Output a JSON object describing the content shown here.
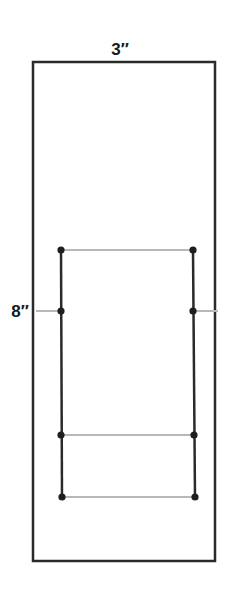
{
  "diagram": {
    "labels": {
      "width": "3″",
      "height": "8″"
    },
    "colors": {
      "outline": "#2a2a2a",
      "guide": "#b8b8b8",
      "dot": "#1e1e1e",
      "background": "#ffffff"
    },
    "outer_rect": {
      "x": 33,
      "y": 62,
      "width": 182,
      "height": 499
    },
    "inner_frame": {
      "left_x": 61,
      "right_x": 194,
      "top_y": 250,
      "bottom_y": 497
    },
    "points": [
      {
        "id": "top-left",
        "x": 61,
        "y": 250
      },
      {
        "id": "top-right",
        "x": 193,
        "y": 250
      },
      {
        "id": "mid-left",
        "x": 61,
        "y": 311
      },
      {
        "id": "mid-right",
        "x": 193,
        "y": 311
      },
      {
        "id": "lower-left",
        "x": 61,
        "y": 435
      },
      {
        "id": "lower-right",
        "x": 194,
        "y": 435
      },
      {
        "id": "bottom-left",
        "x": 62,
        "y": 497
      },
      {
        "id": "bottom-right",
        "x": 195,
        "y": 497
      }
    ],
    "guides": [
      {
        "id": "top-guide",
        "x1": 61,
        "y1": 250,
        "x2": 193,
        "y2": 250
      },
      {
        "id": "height-mark-left",
        "x1": 36,
        "y1": 311,
        "x2": 61,
        "y2": 311
      },
      {
        "id": "height-mark-right",
        "x1": 193,
        "y1": 311,
        "x2": 218,
        "y2": 311
      },
      {
        "id": "lower-guide",
        "x1": 61,
        "y1": 435,
        "x2": 194,
        "y2": 435
      },
      {
        "id": "bottom-guide",
        "x1": 62,
        "y1": 497,
        "x2": 195,
        "y2": 497
      }
    ]
  }
}
